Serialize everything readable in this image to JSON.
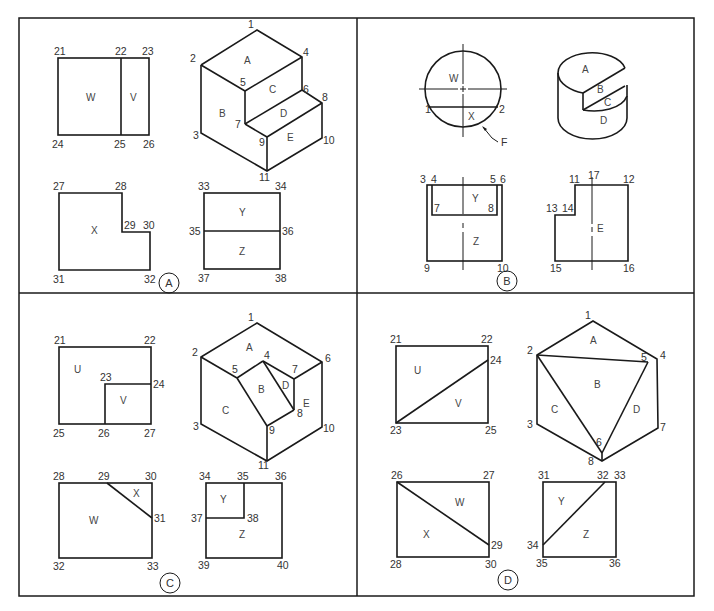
{
  "figure": {
    "panels": [
      {
        "id": "A",
        "badge": "A",
        "ortho_views": {
          "top_left": {
            "points": [
              "21",
              "22",
              "23",
              "24",
              "25",
              "26"
            ],
            "faces": [
              "W",
              "V"
            ]
          },
          "bottom_left": {
            "points": [
              "27",
              "28",
              "29",
              "30",
              "31",
              "32"
            ],
            "faces": [
              "X"
            ]
          },
          "bottom_right": {
            "points": [
              "33",
              "34",
              "35",
              "36",
              "37",
              "38"
            ],
            "faces": [
              "Y",
              "Z"
            ]
          }
        },
        "pictorial": {
          "points": [
            "1",
            "2",
            "3",
            "4",
            "5",
            "6",
            "7",
            "8",
            "9",
            "10",
            "11"
          ],
          "faces": [
            "A",
            "B",
            "C",
            "D",
            "E"
          ]
        }
      },
      {
        "id": "B",
        "badge": "B",
        "top_view": {
          "points": [
            "1",
            "2"
          ],
          "faces": [
            "W",
            "X"
          ],
          "leader_label": "F"
        },
        "pictorial": {
          "faces": [
            "A",
            "B",
            "C",
            "D"
          ]
        },
        "front_view": {
          "points": [
            "3",
            "4",
            "5",
            "6",
            "7",
            "8",
            "9",
            "10"
          ],
          "faces": [
            "Y",
            "Z"
          ]
        },
        "side_view": {
          "points": [
            "11",
            "12",
            "13",
            "14",
            "15",
            "16",
            "17"
          ],
          "faces": [
            "E"
          ]
        }
      },
      {
        "id": "C",
        "badge": "C",
        "ortho_views": {
          "top_left": {
            "points": [
              "21",
              "22",
              "23",
              "24",
              "25",
              "26",
              "27"
            ],
            "faces": [
              "U",
              "V"
            ]
          },
          "bottom_left": {
            "points": [
              "28",
              "29",
              "30",
              "31",
              "32",
              "33"
            ],
            "faces": [
              "W",
              "X"
            ]
          },
          "bottom_right": {
            "points": [
              "34",
              "35",
              "36",
              "37",
              "38",
              "39",
              "40"
            ],
            "faces": [
              "Y",
              "Z"
            ]
          }
        },
        "pictorial": {
          "points": [
            "1",
            "2",
            "3",
            "4",
            "5",
            "6",
            "7",
            "8",
            "9",
            "10",
            "11"
          ],
          "faces": [
            "A",
            "B",
            "C",
            "D",
            "E"
          ]
        }
      },
      {
        "id": "D",
        "badge": "D",
        "ortho_views": {
          "top_left": {
            "points": [
              "21",
              "22",
              "23",
              "24",
              "25"
            ],
            "faces": [
              "U",
              "V"
            ]
          },
          "bottom_left": {
            "points": [
              "26",
              "27",
              "28",
              "29",
              "30"
            ],
            "faces": [
              "W",
              "X"
            ]
          },
          "bottom_right": {
            "points": [
              "31",
              "32",
              "33",
              "34",
              "35",
              "36"
            ],
            "faces": [
              "Y",
              "Z"
            ]
          }
        },
        "pictorial": {
          "points": [
            "1",
            "2",
            "3",
            "4",
            "5",
            "6",
            "7",
            "8"
          ],
          "faces": [
            "A",
            "B",
            "C",
            "D"
          ]
        }
      }
    ]
  },
  "labels": {
    "A": {
      "p21": "21",
      "p22": "22",
      "p23": "23",
      "p24": "24",
      "p25": "25",
      "p26": "26",
      "fW": "W",
      "fV": "V",
      "p27": "27",
      "p28": "28",
      "p29": "29",
      "p30": "30",
      "p31": "31",
      "p32": "32",
      "fX": "X",
      "p33": "33",
      "p34": "34",
      "p35": "35",
      "p36": "36",
      "p37": "37",
      "p38": "38",
      "fY": "Y",
      "fZ": "Z",
      "i1": "1",
      "i2": "2",
      "i3": "3",
      "i4": "4",
      "i5": "5",
      "i6": "6",
      "i7": "7",
      "i8": "8",
      "i9": "9",
      "i10": "10",
      "i11": "11",
      "iA": "A",
      "iB": "B",
      "iC": "C",
      "iD": "D",
      "iE": "E",
      "badge": "A"
    },
    "B": {
      "fW": "W",
      "fX": "X",
      "p1": "1",
      "p2": "2",
      "leader": "F",
      "iA": "A",
      "iB": "B",
      "iC": "C",
      "iD": "D",
      "p3": "3",
      "p4": "4",
      "p5": "5",
      "p6": "6",
      "p7": "7",
      "p8": "8",
      "p9": "9",
      "p10": "10",
      "fY": "Y",
      "fZ": "Z",
      "p11": "11",
      "p12": "12",
      "p13": "13",
      "p14": "14",
      "p15": "15",
      "p16": "16",
      "p17": "17",
      "fE": "E",
      "badge": "B"
    },
    "C": {
      "p21": "21",
      "p22": "22",
      "p23": "23",
      "p24": "24",
      "p25": "25",
      "p26": "26",
      "p27": "27",
      "fU": "U",
      "fV": "V",
      "p28": "28",
      "p29": "29",
      "p30": "30",
      "p31": "31",
      "p32": "32",
      "p33": "33",
      "fW": "W",
      "fX": "X",
      "p34": "34",
      "p35": "35",
      "p36": "36",
      "p37": "37",
      "p38": "38",
      "p39": "39",
      "p40": "40",
      "fY": "Y",
      "fZ": "Z",
      "i1": "1",
      "i2": "2",
      "i3": "3",
      "i4": "4",
      "i5": "5",
      "i6": "6",
      "i7": "7",
      "i8": "8",
      "i9": "9",
      "i10": "10",
      "i11": "11",
      "iA": "A",
      "iB": "B",
      "iC": "C",
      "iD": "D",
      "iE": "E",
      "badge": "C"
    },
    "D": {
      "p21": "21",
      "p22": "22",
      "p23": "23",
      "p24": "24",
      "p25": "25",
      "fU": "U",
      "fV": "V",
      "p26": "26",
      "p27": "27",
      "p28": "28",
      "p29": "29",
      "p30": "30",
      "fW": "W",
      "fX": "X",
      "p31": "31",
      "p32": "32",
      "p33": "33",
      "p34": "34",
      "p35": "35",
      "p36": "36",
      "fY": "Y",
      "fZ": "Z",
      "i1": "1",
      "i2": "2",
      "i3": "3",
      "i4": "4",
      "i5": "5",
      "i6": "6",
      "i7": "7",
      "i8": "8",
      "iA": "A",
      "iB": "B",
      "iC": "C",
      "iD": "D",
      "badge": "D"
    }
  },
  "colors": {
    "line": "#1a1a1a",
    "text": "#333333",
    "background": "#ffffff"
  }
}
